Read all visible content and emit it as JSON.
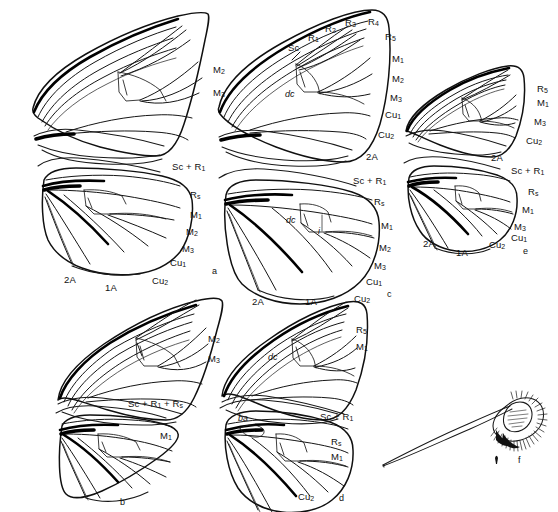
{
  "figure": {
    "kind": "scientific-plate",
    "background_color": "#ffffff",
    "ink_color": "#111111",
    "width": 558,
    "height": 512
  },
  "panels": [
    {
      "id": "a",
      "label": "a",
      "label_pos": [
        212,
        266
      ],
      "forewing_labels": [
        {
          "text": "M",
          "sub": "2",
          "x": 213,
          "y": 65
        },
        {
          "text": "M",
          "sub": "3",
          "x": 213,
          "y": 88
        }
      ],
      "hindwing_labels": [
        {
          "text": "Sc + R",
          "sub": "1",
          "x": 172,
          "y": 162
        },
        {
          "text": "R",
          "sub": "s",
          "x": 190,
          "y": 190
        },
        {
          "text": "M",
          "sub": "1",
          "x": 190,
          "y": 210
        },
        {
          "text": "M",
          "sub": "2",
          "x": 186,
          "y": 227
        },
        {
          "text": "M",
          "sub": "3",
          "x": 182,
          "y": 244
        },
        {
          "text": "Cu",
          "sub": "1",
          "x": 170,
          "y": 258
        },
        {
          "text": "Cu",
          "sub": "2",
          "x": 152,
          "y": 276
        },
        {
          "text": "2A",
          "sub": "",
          "x": 64,
          "y": 275
        },
        {
          "text": "1A",
          "sub": "",
          "x": 105,
          "y": 283
        }
      ]
    },
    {
      "id": "b",
      "label": "b",
      "label_pos": [
        120,
        497
      ],
      "forewing_labels": [
        {
          "text": "M",
          "sub": "2",
          "x": 208,
          "y": 334
        },
        {
          "text": "M",
          "sub": "3",
          "x": 208,
          "y": 354
        }
      ],
      "hindwing_labels": [
        {
          "text": "Sc + R",
          "sub": "1",
          "x": 128,
          "y": 399,
          "suffix": " + R",
          "suffix_sub": "s"
        },
        {
          "text": "M",
          "sub": "1",
          "x": 160,
          "y": 431
        }
      ]
    },
    {
      "id": "c",
      "label": "c",
      "label_pos": [
        387,
        289
      ],
      "forewing_labels": [
        {
          "text": "Sc",
          "sub": "",
          "x": 288,
          "y": 43
        },
        {
          "text": "R",
          "sub": "1",
          "x": 308,
          "y": 33
        },
        {
          "text": "R",
          "sub": "2",
          "x": 325,
          "y": 24
        },
        {
          "text": "R",
          "sub": "3",
          "x": 345,
          "y": 18
        },
        {
          "text": "R",
          "sub": "4",
          "x": 368,
          "y": 17
        },
        {
          "text": "R",
          "sub": "5",
          "x": 385,
          "y": 32
        },
        {
          "text": "M",
          "sub": "1",
          "x": 392,
          "y": 54
        },
        {
          "text": "M",
          "sub": "2",
          "x": 392,
          "y": 74
        },
        {
          "text": "M",
          "sub": "3",
          "x": 390,
          "y": 93
        },
        {
          "text": "Cu",
          "sub": "1",
          "x": 385,
          "y": 110
        },
        {
          "text": "Cu",
          "sub": "2",
          "x": 378,
          "y": 130
        },
        {
          "text": "2A",
          "sub": "",
          "x": 366,
          "y": 152
        },
        {
          "text": "dc",
          "sub": "",
          "x": 285,
          "y": 90,
          "italic": true
        }
      ],
      "hindwing_labels": [
        {
          "text": "Sc + R",
          "sub": "1",
          "x": 353,
          "y": 176
        },
        {
          "text": "R",
          "sub": "s",
          "x": 374,
          "y": 197
        },
        {
          "text": "M",
          "sub": "1",
          "x": 381,
          "y": 221
        },
        {
          "text": "M",
          "sub": "2",
          "x": 379,
          "y": 243
        },
        {
          "text": "M",
          "sub": "3",
          "x": 374,
          "y": 261
        },
        {
          "text": "Cu",
          "sub": "1",
          "x": 366,
          "y": 277
        },
        {
          "text": "Cu",
          "sub": "2",
          "x": 354,
          "y": 294
        },
        {
          "text": "2A",
          "sub": "",
          "x": 252,
          "y": 297
        },
        {
          "text": "1A",
          "sub": "",
          "x": 305,
          "y": 297
        },
        {
          "text": "dc",
          "sub": "",
          "x": 286,
          "y": 216,
          "italic": true
        },
        {
          "text": "i",
          "sub": "",
          "x": 318,
          "y": 227,
          "italic": true
        }
      ]
    },
    {
      "id": "d",
      "label": "d",
      "label_pos": [
        339,
        493
      ],
      "forewing_labels": [
        {
          "text": "R",
          "sub": "5",
          "x": 356,
          "y": 325
        },
        {
          "text": "M",
          "sub": "1",
          "x": 356,
          "y": 342
        },
        {
          "text": "dc",
          "sub": "",
          "x": 268,
          "y": 353,
          "italic": true
        }
      ],
      "hindwing_labels": [
        {
          "text": "Sc + R",
          "sub": "1",
          "x": 320,
          "y": 412
        },
        {
          "text": "R",
          "sub": "s",
          "x": 331,
          "y": 437
        },
        {
          "text": "M",
          "sub": "1",
          "x": 331,
          "y": 452
        },
        {
          "text": "Cu",
          "sub": "2",
          "x": 298,
          "y": 492
        },
        {
          "text": "ba",
          "sub": "",
          "x": 238,
          "y": 414,
          "italic": true
        }
      ]
    },
    {
      "id": "e",
      "label": "e",
      "label_pos": [
        523,
        246
      ],
      "forewing_labels": [
        {
          "text": "R",
          "sub": "5",
          "x": 537,
          "y": 84
        },
        {
          "text": "M",
          "sub": "1",
          "x": 537,
          "y": 98
        },
        {
          "text": "M",
          "sub": "3",
          "x": 534,
          "y": 117
        },
        {
          "text": "Cu",
          "sub": "2",
          "x": 526,
          "y": 136
        },
        {
          "text": "2A",
          "sub": "",
          "x": 491,
          "y": 153
        }
      ],
      "hindwing_labels": [
        {
          "text": "Sc + R",
          "sub": "1",
          "x": 511,
          "y": 166
        },
        {
          "text": "R",
          "sub": "s",
          "x": 528,
          "y": 187
        },
        {
          "text": "M",
          "sub": "1",
          "x": 522,
          "y": 205
        },
        {
          "text": "M",
          "sub": "3",
          "x": 514,
          "y": 222
        },
        {
          "text": "Cu",
          "sub": "1",
          "x": 511,
          "y": 233
        },
        {
          "text": "Cu",
          "sub": "2",
          "x": 489,
          "y": 240
        },
        {
          "text": "2A",
          "sub": "",
          "x": 423,
          "y": 239
        },
        {
          "text": "1A",
          "sub": "",
          "x": 456,
          "y": 248
        }
      ]
    },
    {
      "id": "f",
      "label": "f",
      "label_pos": [
        518,
        455
      ],
      "description": "scale / androconial structure with long tapering shaft",
      "forewing_labels": [],
      "hindwing_labels": []
    }
  ],
  "vein_glossary": {
    "Sc": "subcosta",
    "R1": "radius 1",
    "R2": "radius 2",
    "R3": "radius 3",
    "R4": "radius 4",
    "R5": "radius 5",
    "Rs": "radial sector",
    "M1": "media 1",
    "M2": "media 2",
    "M3": "media 3",
    "Cu1": "cubitus 1",
    "Cu2": "cubitus 2",
    "1A": "first anal",
    "2A": "second anal",
    "dc": "discal cell",
    "ba": "basal areole",
    "i": "intercalary vein"
  }
}
